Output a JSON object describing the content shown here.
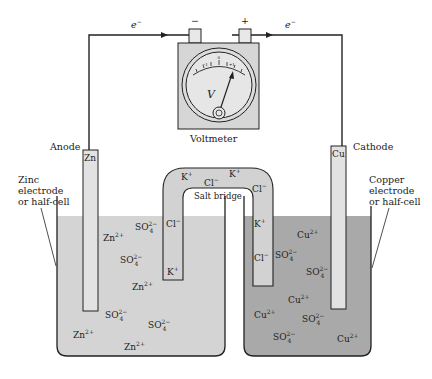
{
  "colors": {
    "zinc_solution": "#d4d4d4",
    "copper_solution": "#a9a9a9",
    "electrode": "#e2e2e2",
    "salt_bridge": "#d2d2d2",
    "voltmeter_body": "#d6d6d6",
    "line": "#222222"
  },
  "labels": {
    "electron_left": "e",
    "electron_right": "e",
    "electron_sup": "−",
    "minus_terminal": "−",
    "plus_terminal": "+",
    "voltmeter": "Voltmeter",
    "meter_symbol": "V",
    "meter_zero": "0",
    "meter_minus": "−1",
    "meter_plus": "+1",
    "anode": "Anode",
    "cathode": "Cathode",
    "zn_electrode": "Zn",
    "cu_electrode": "Cu",
    "zinc_note_1": "Zinc",
    "zinc_note_2": "electrode",
    "zinc_note_3": "or half-cell",
    "copper_note_1": "Copper",
    "copper_note_2": "electrode",
    "copper_note_3": "or half-cell",
    "salt_bridge": "Salt bridge"
  },
  "ions": {
    "zn": "Zn",
    "zn_charge": "2+",
    "cu": "Cu",
    "cu_charge": "2+",
    "so4": "SO",
    "so4_sub": "4",
    "so4_charge": "2−",
    "k": "K",
    "k_charge": "+",
    "cl": "Cl",
    "cl_charge": "−"
  }
}
